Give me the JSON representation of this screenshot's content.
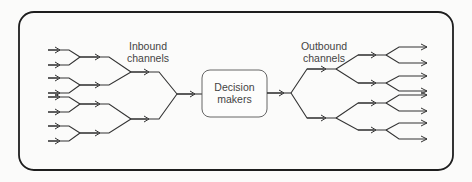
{
  "diagram": {
    "type": "channel-tree",
    "inbound_label_line1": "Inbound",
    "inbound_label_line2": "channels",
    "outbound_label_line1": "Outbound",
    "outbound_label_line2": "channels",
    "center_label_line1": "Decision",
    "center_label_line2": "makers",
    "inbound_inputs": 8,
    "outbound_outputs": 8,
    "colors": {
      "stroke": "#333333",
      "frame": "#1e1e1e",
      "background": "#fbfbfa"
    }
  }
}
